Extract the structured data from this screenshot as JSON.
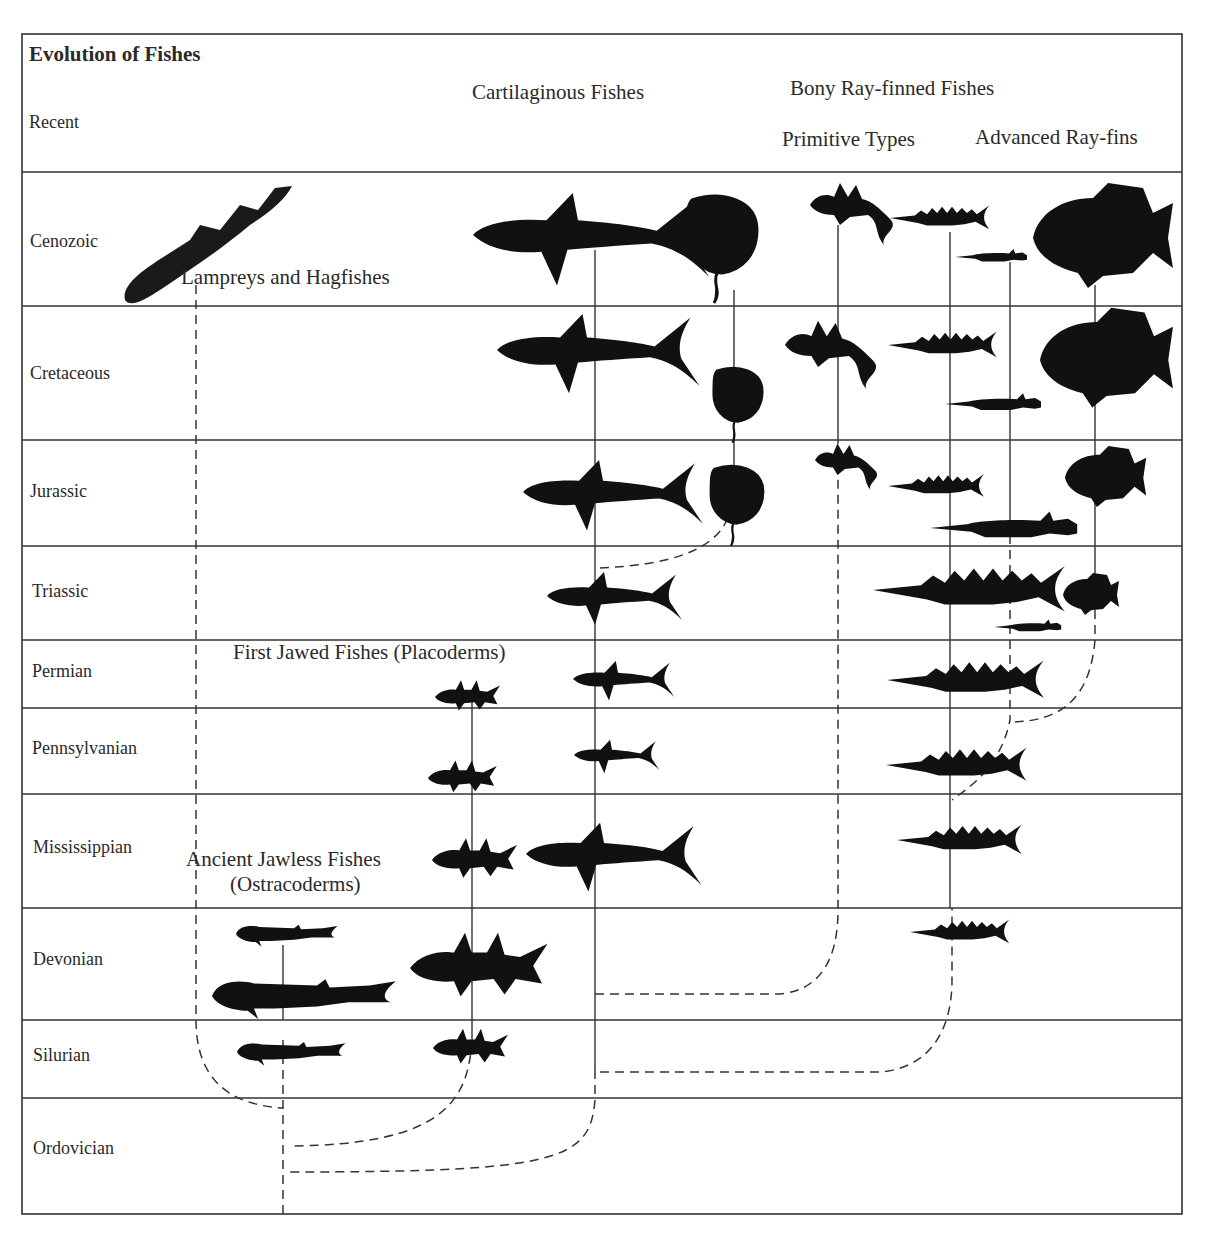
{
  "title": "Evolution of Fishes",
  "header_row_label": "Recent",
  "periods": [
    "Cenozoic",
    "Cretaceous",
    "Jurassic",
    "Triassic",
    "Permian",
    "Pennsylvanian",
    "Mississippian",
    "Devonian",
    "Silurian",
    "Ordovician"
  ],
  "column_headers": {
    "cartilaginous": "Cartilaginous Fishes",
    "bony": "Bony Ray-finned Fishes",
    "primitive": "Primitive Types",
    "advanced": "Advanced Ray-fins"
  },
  "group_labels": {
    "lampreys": "Lampreys and Hagfishes",
    "placoderms": "First Jawed Fishes (Placoderms)",
    "ostracoderms_1": "Ancient Jawless Fishes",
    "ostracoderms_2": "(Ostracoderms)"
  },
  "colors": {
    "ink": "#1a1a1a",
    "line": "#333333",
    "background": "#ffffff"
  }
}
